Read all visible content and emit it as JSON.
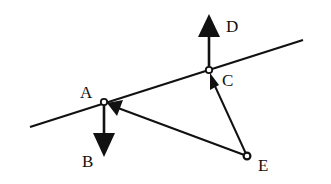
{
  "diagram": {
    "type": "force-vector-diagram",
    "line": {
      "x1": 30,
      "y1": 127,
      "x2": 303,
      "y2": 40
    },
    "points": {
      "A": {
        "x": 104,
        "y": 102,
        "label": "A",
        "label_x": 80,
        "label_y": 98
      },
      "B": {
        "label": "B",
        "label_x": 82,
        "label_y": 167
      },
      "C": {
        "x": 209,
        "y": 70,
        "label": "C",
        "label_x": 222,
        "label_y": 86
      },
      "D": {
        "label": "D",
        "label_x": 226,
        "label_y": 32
      },
      "E": {
        "x": 247,
        "y": 156,
        "label": "E",
        "label_x": 258,
        "label_y": 171
      }
    },
    "arrows": [
      {
        "name": "A-to-B",
        "from": "A",
        "to_x": 104,
        "to_y": 157
      },
      {
        "name": "C-to-D",
        "from": "C",
        "to_x": 209,
        "to_y": 14
      },
      {
        "name": "E-to-A",
        "from": "E",
        "to": "A"
      },
      {
        "name": "E-to-C",
        "from": "E",
        "to": "C"
      }
    ],
    "colors": {
      "stroke": "#111111",
      "background": "#ffffff"
    }
  }
}
